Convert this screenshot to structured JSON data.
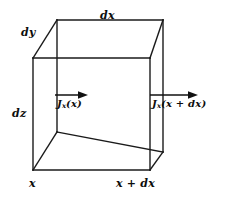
{
  "figure": {
    "type": "diagram",
    "background_color": "#ffffff",
    "line_color": "#1a1a1a",
    "text_color": "#0d0d0d",
    "labels": {
      "dx": "dx",
      "dy": "dy",
      "dz": "dz",
      "x": "x",
      "x_plus_dx": "x + dx",
      "flux_in_symbol": "J",
      "flux_in_subscript": "x",
      "flux_in_argument": "(x)",
      "flux_out_symbol": "J",
      "flux_out_subscript": "x",
      "flux_out_argument": "(x + dx)"
    },
    "geometry": {
      "front_face": {
        "top_left": [
          33,
          58
        ],
        "top_right": [
          150,
          58
        ],
        "bottom_right": [
          150,
          170
        ],
        "bottom_left": [
          33,
          170
        ]
      },
      "back_face": {
        "top_left": [
          57,
          20
        ],
        "top_right": [
          163,
          20
        ],
        "bottom_right": [
          163,
          152
        ],
        "bottom_left": [
          57,
          132
        ]
      },
      "arrow_in": {
        "x1": 55,
        "y1": 95,
        "x2": 86,
        "y2": 95
      },
      "arrow_out": {
        "x1": 150,
        "y1": 95,
        "x2": 196,
        "y2": 95
      }
    }
  }
}
